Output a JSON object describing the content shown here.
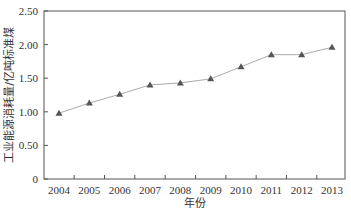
{
  "chart_data": {
    "type": "line",
    "title": "",
    "xlabel": "年份",
    "ylabel": "工业能源消耗量/亿吨标准煤",
    "categories": [
      "2004",
      "2005",
      "2006",
      "2007",
      "2008",
      "2009",
      "2010",
      "2011",
      "2012",
      "2013"
    ],
    "series": [
      {
        "name": "工业能源消耗量",
        "values": [
          0.98,
          1.13,
          1.26,
          1.4,
          1.43,
          1.49,
          1.67,
          1.85,
          1.85,
          1.96
        ],
        "marker": "triangle",
        "color": "#555555",
        "line_color": "#aaaaaa"
      }
    ],
    "yticks": [
      "0",
      "0.50",
      "1.00",
      "1.50",
      "2.00",
      "2.50"
    ],
    "ylim": [
      0,
      2.5
    ],
    "grid": false,
    "legend": "none"
  }
}
